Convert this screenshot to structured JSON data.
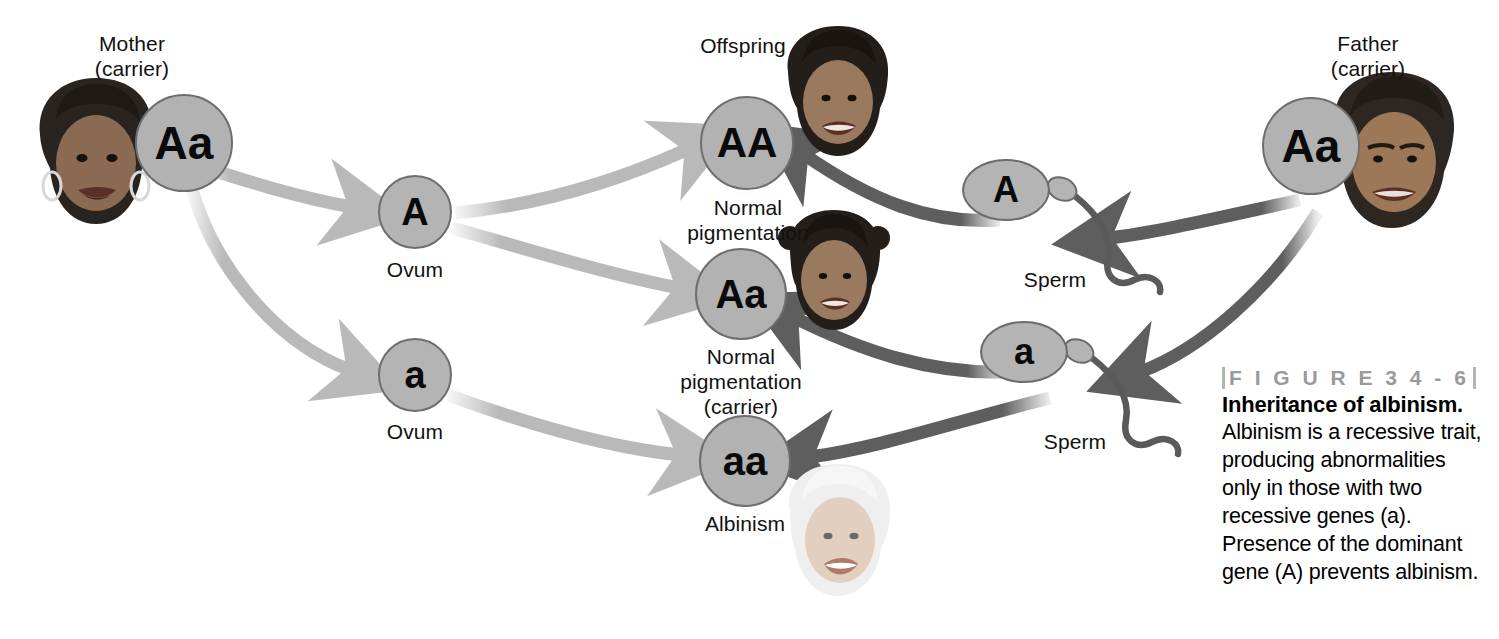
{
  "figure": {
    "number_label": "F I G U R E   3 4 - 6",
    "title": "Inheritance of albinism.",
    "body_text": "Albinism is a recessive trait, producing abnormalities only in those with two recessive genes (a). Presence of the dominant gene (A) prevents albinism."
  },
  "parents": {
    "mother": {
      "title": "Mother",
      "subtitle": "(carrier)",
      "label": "Mother\n(carrier)",
      "genotype": "Aa"
    },
    "father": {
      "title": "Father",
      "subtitle": "(carrier)",
      "label": "Father\n(carrier)",
      "genotype": "Aa"
    }
  },
  "gametes": {
    "ova": [
      {
        "allele": "A",
        "label": "Ovum"
      },
      {
        "allele": "a",
        "label": "Ovum"
      }
    ],
    "sperm": [
      {
        "allele": "A",
        "label": "Sperm"
      },
      {
        "allele": "a",
        "label": "Sperm"
      }
    ]
  },
  "offspring": {
    "heading": "Offspring",
    "items": [
      {
        "genotype": "AA",
        "phenotype": "Normal\npigmentation"
      },
      {
        "genotype": "Aa",
        "phenotype": "Normal\npigmentation\n(carrier)"
      },
      {
        "genotype": "aa",
        "phenotype": "Albinism"
      }
    ]
  },
  "colors": {
    "circle_fill": "#b2b2b2",
    "circle_stroke": "#6e6e6e",
    "maternal_arrow": "#b9b9b9",
    "paternal_arrow": "#5e5e5e",
    "figure_number": "#9a9a9a"
  }
}
